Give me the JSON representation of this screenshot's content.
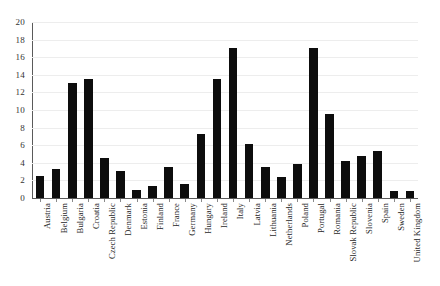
{
  "chart_data": {
    "type": "bar",
    "title": "",
    "subtitle": "",
    "xlabel": "",
    "ylabel": "",
    "ylim": [
      0,
      20
    ],
    "yticks": [
      0,
      2,
      4,
      6,
      8,
      10,
      12,
      14,
      16,
      18,
      20
    ],
    "grid": true,
    "legend": false,
    "legend_position": "none",
    "bar_color": "#0d0d0d",
    "gridline_color": "#ededed",
    "axis_color": "#5a5a5a",
    "categories": [
      "Austria",
      "Belgium",
      "Bulgaria",
      "Croatia",
      "Czech Republic",
      "Denmark",
      "Estonia",
      "Finland",
      "France",
      "Germany",
      "Hungary",
      "Ireland",
      "Italy",
      "Latvia",
      "Lithuania",
      "Netherlands",
      "Poland",
      "Portugal",
      "Romania",
      "Slovak Republic",
      "Slovenia",
      "Spain",
      "Sweden",
      "United Kingdom"
    ],
    "values": [
      2.5,
      3.3,
      13.1,
      13.5,
      4.5,
      3.1,
      0.9,
      1.4,
      3.5,
      1.6,
      7.3,
      13.5,
      17.0,
      6.1,
      3.5,
      2.4,
      3.9,
      17.0,
      9.6,
      4.2,
      4.8,
      5.3,
      0.8,
      0.8
    ]
  }
}
